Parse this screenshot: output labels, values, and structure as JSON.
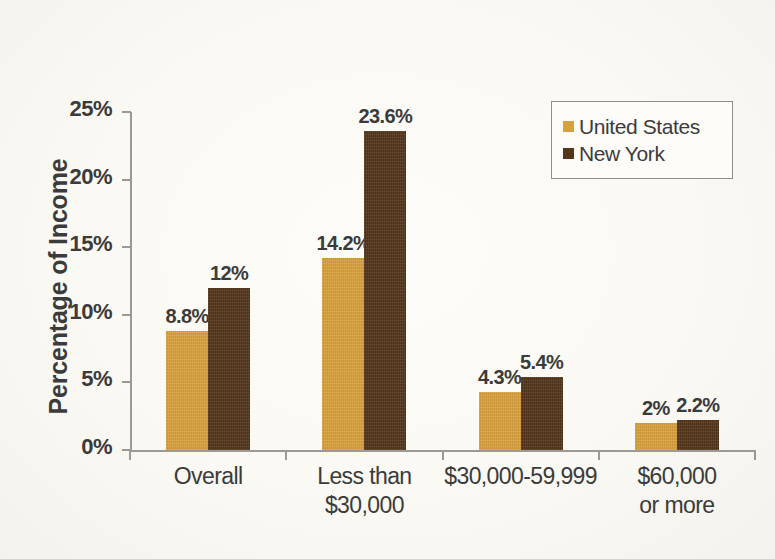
{
  "chart_data": {
    "type": "bar",
    "title": "",
    "subtitle": "",
    "xlabel": "",
    "ylabel": "Percentage of Income",
    "ylim": [
      0,
      25
    ],
    "ytick_values": [
      0,
      5,
      10,
      15,
      20,
      25
    ],
    "ytick_labels": [
      "0%",
      "5%",
      "10%",
      "15%",
      "20%",
      "25%"
    ],
    "grid": false,
    "legend_position": "top-right",
    "categories": [
      "Overall",
      "Less than\n$30,000",
      "$30,000-59,999",
      "$60,000\nor more"
    ],
    "series": [
      {
        "name": "United States",
        "color": "#d9a13e",
        "values": [
          8.8,
          14.2,
          4.3,
          2
        ],
        "value_labels": [
          "8.8%",
          "14.2%",
          "4.3%",
          "2%"
        ]
      },
      {
        "name": "New York",
        "color": "#54361a",
        "values": [
          12,
          23.6,
          5.4,
          2.2
        ],
        "value_labels": [
          "12%",
          "23.6%",
          "5.4%",
          "2.2%"
        ]
      }
    ]
  },
  "legend": {
    "entries": [
      {
        "label": "United States",
        "color": "#d9a13e"
      },
      {
        "label": "New York",
        "color": "#54361a"
      }
    ]
  },
  "axes": {
    "y_label": "Percentage of Income",
    "y_ticks": [
      "0%",
      "5%",
      "10%",
      "15%",
      "20%",
      "25%"
    ],
    "x_ticks": [
      "Overall",
      "Less than\n$30,000",
      "$30,000-59,999",
      "$60,000\nor more"
    ]
  },
  "colors": {
    "background": "#faf9f4",
    "axis": "#9b9a96",
    "text": "#3b3b3b",
    "series_us": "#d9a13e",
    "series_ny": "#54361a"
  }
}
